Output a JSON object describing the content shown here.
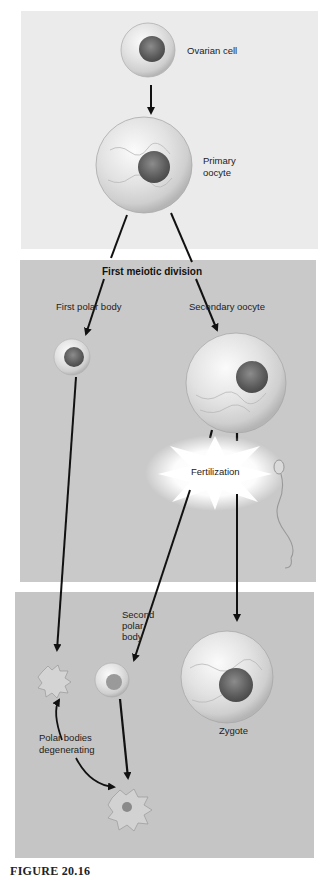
{
  "figure": {
    "caption": "FIGURE 20.16"
  },
  "panels": {
    "top": {
      "color": "#ebebeb",
      "labels": {
        "ovarian_cell": "Ovarian cell",
        "primary_oocyte_line1": "Primary",
        "primary_oocyte_line2": "oocyte"
      }
    },
    "middle": {
      "color": "#c9c9c9",
      "labels": {
        "first_meiotic_division": "First meiotic division",
        "first_polar_body": "First polar body",
        "secondary_oocyte": "Secondary oocyte",
        "fertilization": "Fertilization"
      }
    },
    "bottom": {
      "color": "#c5c5c5",
      "labels": {
        "second_polar_body_line1": "Second",
        "second_polar_body_line2": "polar",
        "second_polar_body_line3": "body",
        "zygote": "Zygote",
        "polar_bodies_degenerating_line1": "Polar bodies",
        "polar_bodies_degenerating_line2": "degenerating"
      }
    }
  },
  "nodes": [
    {
      "id": "ovarian-cell",
      "label": "Ovarian cell"
    },
    {
      "id": "primary-oocyte",
      "label": "Primary oocyte"
    },
    {
      "id": "first-polar-body",
      "label": "First polar body"
    },
    {
      "id": "secondary-oocyte",
      "label": "Secondary oocyte"
    },
    {
      "id": "fertilization",
      "label": "Fertilization"
    },
    {
      "id": "sperm",
      "label": ""
    },
    {
      "id": "second-polar-body",
      "label": "Second polar body"
    },
    {
      "id": "zygote",
      "label": "Zygote"
    },
    {
      "id": "degenerating-polar-body-1",
      "label": "Polar bodies degenerating"
    },
    {
      "id": "degenerating-polar-body-2",
      "label": "Polar bodies degenerating"
    }
  ],
  "edges": [
    {
      "from": "ovarian-cell",
      "to": "primary-oocyte"
    },
    {
      "from": "primary-oocyte",
      "to": "first-polar-body",
      "label": "First meiotic division"
    },
    {
      "from": "primary-oocyte",
      "to": "secondary-oocyte",
      "label": "First meiotic division"
    },
    {
      "from": "secondary-oocyte",
      "to": "fertilization"
    },
    {
      "from": "sperm",
      "to": "fertilization"
    },
    {
      "from": "fertilization",
      "to": "second-polar-body"
    },
    {
      "from": "fertilization",
      "to": "zygote"
    },
    {
      "from": "first-polar-body",
      "to": "degenerating-polar-body-1"
    },
    {
      "from": "second-polar-body",
      "to": "degenerating-polar-body-2"
    }
  ]
}
